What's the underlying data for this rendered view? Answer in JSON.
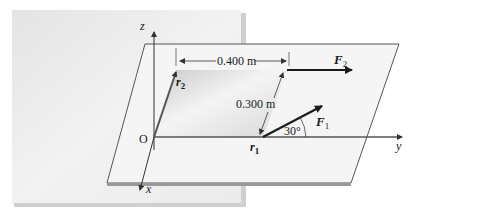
{
  "figure": {
    "axes": {
      "z": "z",
      "y": "y",
      "x": "x",
      "origin": "O"
    },
    "dimensions": {
      "width": "0.400 m",
      "height": "0.300 m"
    },
    "vectors": {
      "r1": {
        "symbol": "r",
        "sub": "1"
      },
      "r2": {
        "symbol": "r",
        "sub": "2"
      },
      "F1": {
        "symbol": "F",
        "sub": "1"
      },
      "F2": {
        "symbol": "F",
        "sub": "2"
      }
    },
    "angle": "30°",
    "colors": {
      "background": "#ececec",
      "plate": "#f4f4f4",
      "edge": "#555555",
      "vector": "#1a1a1a"
    }
  }
}
